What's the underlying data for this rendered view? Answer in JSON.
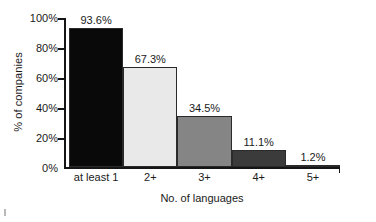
{
  "chart_data": {
    "type": "bar",
    "title": "",
    "xlabel": "No. of languages",
    "ylabel": "% of companies",
    "categories": [
      "at least 1",
      "2+",
      "3+",
      "4+",
      "5+"
    ],
    "values": [
      93.6,
      67.3,
      34.5,
      11.1,
      1.2
    ],
    "value_labels": [
      "93.6%",
      "67.3%",
      "34.5%",
      "11.1%",
      "1.2%"
    ],
    "ylim": [
      0,
      100
    ],
    "yticks": [
      0,
      20,
      40,
      60,
      80,
      100
    ],
    "ytick_labels": [
      "0%",
      "20%",
      "40%",
      "60%",
      "80%",
      "100%"
    ],
    "grid": false,
    "legend": "none",
    "bar_colors": [
      "#090909",
      "#e9e9e9",
      "#858585",
      "#3b3b3b",
      "#e3e3e3"
    ],
    "bar_edge_color": "#2a2a2a",
    "axis_color": "#151515",
    "background": "#ffffff"
  }
}
